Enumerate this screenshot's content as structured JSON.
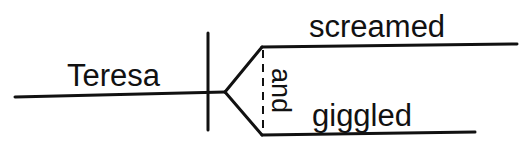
{
  "diagram": {
    "type": "sentence-diagram",
    "subject": "Teresa",
    "conjunction": "and",
    "predicates": [
      "screamed",
      "giggled"
    ],
    "colors": {
      "ink": "#111111",
      "background": "#ffffff"
    }
  }
}
